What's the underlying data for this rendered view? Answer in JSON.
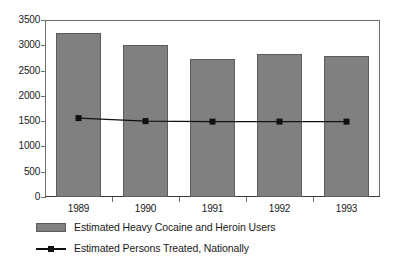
{
  "chart_data": {
    "type": "bar",
    "title": "",
    "subtitle": "",
    "xlabel": "",
    "ylabel": "",
    "categories": [
      "1989",
      "1990",
      "1991",
      "1992",
      "1993"
    ],
    "ylim": [
      0,
      3500
    ],
    "y_ticks": [
      0,
      500,
      1000,
      1500,
      2000,
      2500,
      3000,
      3500
    ],
    "y_tick_labels": [
      "0",
      "500",
      "1000",
      "1500",
      "2000",
      "2500",
      "3000",
      "3500"
    ],
    "grid": false,
    "legend_position": "bottom-left",
    "series": [
      {
        "name": "Estimated Heavy Cocaine and Heroin Users",
        "type": "bar",
        "color": "#808080",
        "values": [
          3250,
          3000,
          2730,
          2830,
          2790
        ]
      },
      {
        "name": "Estimated Persons Treated, Nationally",
        "type": "line",
        "color": "#101010",
        "marker": "square",
        "values": [
          1560,
          1500,
          1490,
          1490,
          1490
        ]
      }
    ]
  },
  "legend": {
    "items": [
      {
        "label": "Estimated Heavy Cocaine and Heroin Users",
        "swatch": "bar-swatch"
      },
      {
        "label": "Estimated Persons Treated, Nationally",
        "swatch": "line-swatch"
      }
    ]
  },
  "colors": {
    "bar_fill": "#808080",
    "bar_stroke": "#5c5c5c",
    "line": "#101010",
    "axis": "#6e6e6e",
    "background": "#ffffff",
    "text": "#1a1a1a"
  }
}
